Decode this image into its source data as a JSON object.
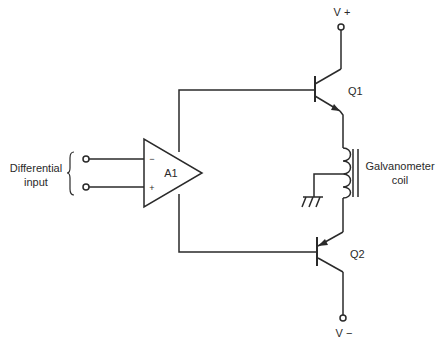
{
  "diagram": {
    "type": "circuit-schematic",
    "labels": {
      "input_line1": "Differential",
      "input_line2": "input",
      "opamp": "A1",
      "opamp_minus": "−",
      "opamp_plus": "+",
      "q1": "Q1",
      "q2": "Q2",
      "vplus": "V +",
      "vminus": "V −",
      "coil_line1": "Galvanometer",
      "coil_line2": "coil"
    },
    "components": [
      {
        "id": "A1",
        "kind": "op-amp"
      },
      {
        "id": "Q1",
        "kind": "npn-transistor"
      },
      {
        "id": "Q2",
        "kind": "pnp-transistor"
      },
      {
        "id": "coil",
        "kind": "inductor-with-core",
        "label": "Galvanometer coil"
      },
      {
        "id": "gnd",
        "kind": "ground"
      }
    ],
    "colors": {
      "ink": "#2a2a2a",
      "background": "#ffffff"
    }
  }
}
